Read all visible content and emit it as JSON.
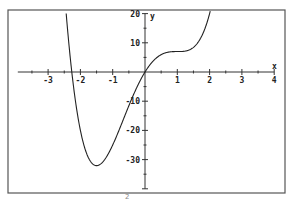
{
  "chart_data": {
    "type": "line",
    "title": "",
    "xlabel": "x",
    "ylabel": "y",
    "xlim": [
      -4,
      4
    ],
    "ylim": [
      -40,
      20
    ],
    "grid": false,
    "x_ticks_major": [
      -3,
      -2,
      -1,
      1,
      2,
      3,
      4
    ],
    "x_tick_labels": [
      "-3",
      "-2",
      "-1",
      "1",
      "2",
      "3",
      "4"
    ],
    "x_ticks_minor_step": 0.5,
    "y_ticks_major": [
      20,
      10,
      -10,
      -20,
      -30
    ],
    "y_tick_labels": [
      "20",
      "10",
      "-10",
      "-20",
      "-30"
    ],
    "y_ticks_minor_step": 5,
    "series": [
      {
        "name": "f(x) = 3x^4 - 2x^3 - 12x^2 + 18x",
        "coefficients_descending": [
          3,
          -2,
          -12,
          18,
          0
        ],
        "x": [
          -2.43,
          -2.27,
          -2.0,
          -1.5,
          -1.0,
          -0.5,
          0,
          0.5,
          1.0,
          1.5,
          2.0,
          2.05
        ],
        "y": [
          20,
          0,
          -20,
          -32.1,
          -25,
          -14.8,
          0,
          6.4,
          7,
          8.8,
          20,
          22.5
        ]
      }
    ],
    "annotations": []
  },
  "caption": {
    "fragment": "2"
  }
}
